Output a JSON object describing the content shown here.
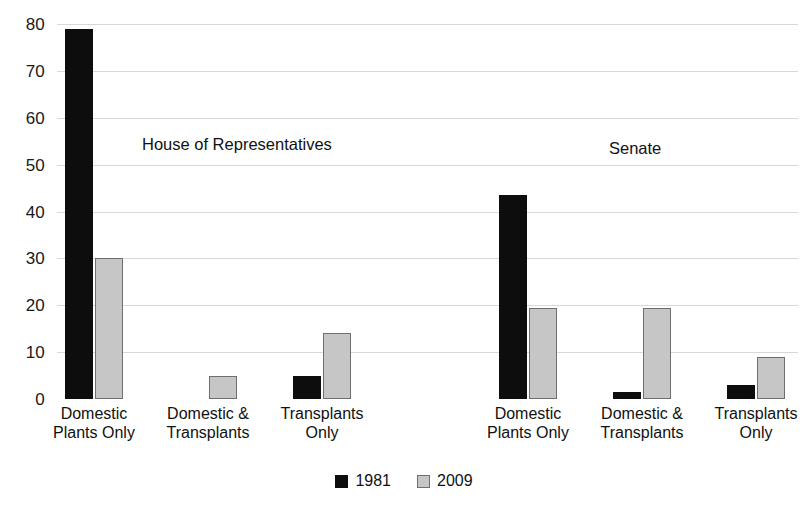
{
  "chart_data": {
    "type": "bar",
    "title": "",
    "subtitle": "",
    "xlabel": "",
    "ylabel": "",
    "ylim": [
      0,
      80
    ],
    "ytick_values": [
      0,
      10,
      20,
      30,
      40,
      50,
      60,
      70,
      80
    ],
    "ytick_labels": [
      "0",
      "10",
      "20",
      "30",
      "40",
      "50",
      "60",
      "70",
      "80"
    ],
    "grid": true,
    "grid_axis": "y",
    "legend_position": "bottom-center",
    "categories": [
      "Domestic\nPlants Only",
      "Domestic &\nTransplants",
      "Transplants\nOnly"
    ],
    "panels": [
      {
        "name": "House of Representatives",
        "series": [
          {
            "name": "1981",
            "color": "#0d0d0d",
            "values": [
              79,
              0,
              5
            ]
          },
          {
            "name": "2009",
            "color": "#c6c6c6",
            "values": [
              30,
              5,
              14
            ]
          }
        ]
      },
      {
        "name": "Senate",
        "series": [
          {
            "name": "1981",
            "color": "#0d0d0d",
            "values": [
              43.5,
              1.5,
              3
            ]
          },
          {
            "name": "2009",
            "color": "#c6c6c6",
            "values": [
              19.5,
              19.5,
              9
            ]
          }
        ]
      }
    ],
    "legend": [
      {
        "label": "1981",
        "color": "#0d0d0d"
      },
      {
        "label": "2009",
        "color": "#c6c6c6"
      }
    ]
  },
  "colors": {
    "series_1981": "#0d0d0d",
    "series_2009": "#c6c6c6",
    "series_2009_border": "#6f6f6f",
    "gridline": "#d8d8d8",
    "text": "#111111",
    "background": "#ffffff"
  }
}
